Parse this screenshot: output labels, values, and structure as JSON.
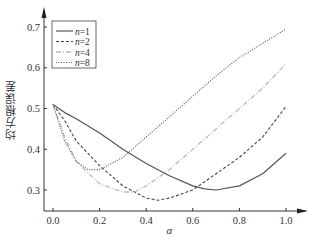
{
  "chart_data": {
    "type": "line",
    "title": "",
    "xlabel": "α",
    "ylabel": "均方根误差",
    "xlim": [
      0.0,
      1.0
    ],
    "ylim": [
      0.25,
      0.72
    ],
    "xticks": [
      "0.0",
      "0.2",
      "0.4",
      "0.6",
      "0.8",
      "1.0"
    ],
    "yticks": [
      "0.3",
      "0.4",
      "0.5",
      "0.6",
      "0.7"
    ],
    "grid": false,
    "legend_position": "upper left",
    "series": [
      {
        "name": "n=1",
        "style": "solid",
        "color": "#555555",
        "x": [
          0.0,
          0.05,
          0.1,
          0.2,
          0.3,
          0.4,
          0.5,
          0.6,
          0.65,
          0.7,
          0.8,
          0.9,
          1.0
        ],
        "values": [
          0.51,
          0.49,
          0.475,
          0.44,
          0.4,
          0.365,
          0.335,
          0.31,
          0.303,
          0.3,
          0.31,
          0.34,
          0.39
        ]
      },
      {
        "name": "n=2",
        "style": "dashed",
        "color": "#444444",
        "x": [
          0.0,
          0.05,
          0.1,
          0.2,
          0.3,
          0.4,
          0.45,
          0.5,
          0.6,
          0.7,
          0.8,
          0.9,
          1.0
        ],
        "values": [
          0.51,
          0.47,
          0.42,
          0.36,
          0.31,
          0.28,
          0.275,
          0.28,
          0.3,
          0.34,
          0.38,
          0.43,
          0.505
        ]
      },
      {
        "name": "n=4",
        "style": "dash-dot",
        "color": "#bbbbbb",
        "x": [
          0.0,
          0.05,
          0.1,
          0.2,
          0.3,
          0.35,
          0.4,
          0.5,
          0.6,
          0.7,
          0.8,
          0.9,
          1.0
        ],
        "values": [
          0.51,
          0.43,
          0.37,
          0.315,
          0.295,
          0.295,
          0.31,
          0.35,
          0.4,
          0.45,
          0.5,
          0.55,
          0.61
        ]
      },
      {
        "name": "n=8",
        "style": "dotted",
        "color": "#555555",
        "x": [
          0.0,
          0.05,
          0.1,
          0.15,
          0.2,
          0.3,
          0.4,
          0.5,
          0.6,
          0.7,
          0.8,
          0.9,
          1.0
        ],
        "values": [
          0.51,
          0.42,
          0.37,
          0.35,
          0.35,
          0.38,
          0.43,
          0.48,
          0.53,
          0.58,
          0.625,
          0.66,
          0.695
        ]
      }
    ]
  }
}
